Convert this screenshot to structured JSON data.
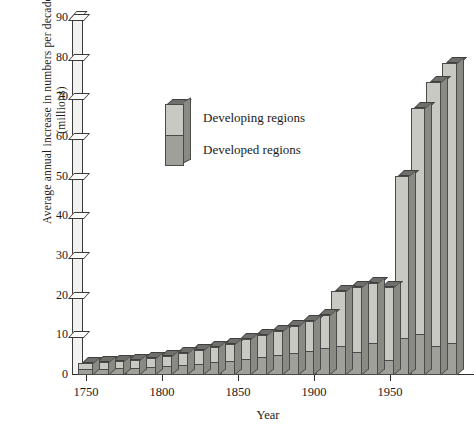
{
  "chart_data": {
    "type": "bar",
    "subtype": "stacked-3d-column",
    "title": "",
    "xlabel": "Year",
    "ylabel": "Average annual increase in numbers per decade (millions)",
    "ylabel_line1": "Average annual increase in numbers per decade",
    "ylabel_line2": "(millions)",
    "ylim": [
      0,
      90
    ],
    "yticks": [
      0,
      10,
      20,
      30,
      40,
      50,
      60,
      70,
      80,
      90
    ],
    "ytick_labels": [
      "0",
      "10",
      "20",
      "30",
      "40",
      "50",
      "60",
      "70",
      "80",
      "90"
    ],
    "xlim": [
      1750,
      1990
    ],
    "xticks": [
      1750,
      1800,
      1850,
      1900,
      1950
    ],
    "xtick_labels": [
      "1750",
      "1800",
      "1850",
      "1900",
      "1950"
    ],
    "grid": false,
    "legend_position": "upper-left-inset",
    "categories": [
      "1750",
      "1760",
      "1770",
      "1780",
      "1790",
      "1800",
      "1810",
      "1820",
      "1830",
      "1840",
      "1850",
      "1860",
      "1870",
      "1880",
      "1890",
      "1900",
      "1910",
      "1920",
      "1930",
      "1940",
      "1950",
      "1960",
      "1970",
      "1980"
    ],
    "series": [
      {
        "name": "Developed regions",
        "color": "#a0a09b",
        "values": [
          1.2,
          1.3,
          1.4,
          1.5,
          1.7,
          1.9,
          2.2,
          2.5,
          2.9,
          3.3,
          3.8,
          4.3,
          4.8,
          5.3,
          5.8,
          6.4,
          7.0,
          5.4,
          7.8,
          3.4,
          9.0,
          9.8,
          6.8,
          7.6
        ]
      },
      {
        "name": "Developing regions",
        "color": "#c9c9c4",
        "values": [
          1.8,
          2.0,
          2.2,
          2.4,
          2.7,
          3.0,
          3.3,
          3.7,
          4.1,
          4.6,
          5.2,
          5.8,
          6.4,
          7.1,
          7.9,
          8.7,
          14.3,
          16.8,
          15.3,
          18.8,
          41.2,
          57.4,
          67.0,
          71.1
        ]
      }
    ],
    "totals": [
      3.0,
      3.3,
      3.6,
      3.9,
      4.4,
      4.9,
      5.5,
      6.2,
      7.0,
      7.9,
      9.0,
      10.1,
      11.2,
      12.4,
      13.7,
      15.1,
      21.3,
      22.2,
      23.1,
      22.2,
      50.2,
      67.2,
      73.8,
      78.7
    ]
  },
  "legend": {
    "items": [
      {
        "label": "Developing regions",
        "color": "#c9c9c4"
      },
      {
        "label": "Developed regions",
        "color": "#a0a09b"
      }
    ]
  }
}
